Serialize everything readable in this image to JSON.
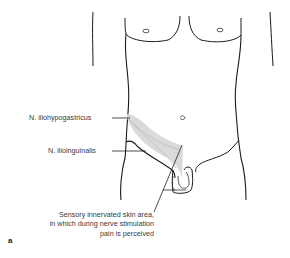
{
  "figure": {
    "panel_label": "a",
    "labels": {
      "iliohypogastricus": "N. iliohypogastricus",
      "ilioinguinalis": "N. ilioinguinalis",
      "sensory_line1": "Sensory innervated skin area,",
      "sensory_line2": "in which during nerve stimulation",
      "sensory_line3": "pain is perceived"
    },
    "colors": {
      "outline": "#1a1a1a",
      "shaded_area": "#d6d6d6",
      "text": "#3a3a3a"
    }
  }
}
